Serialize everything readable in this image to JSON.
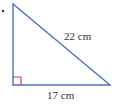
{
  "diagram": {
    "type": "right-triangle",
    "hypotenuse_label": "22 cm",
    "base_label": "17 cm",
    "colors": {
      "line": "#4a72c4",
      "right_angle_marker": "#d9363e",
      "text": "#333333",
      "bullet": "#333333"
    }
  }
}
